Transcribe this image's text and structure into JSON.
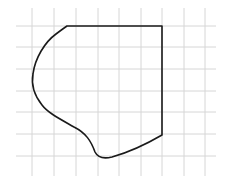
{
  "diagram": {
    "type": "shape-on-grid",
    "colors": {
      "background": "#ffffff",
      "grid": "#d6d6d6",
      "outline": "#1a1a1a"
    },
    "grid": {
      "vertical_x": [
        32,
        54,
        76,
        98,
        119,
        141,
        162,
        184,
        205
      ],
      "vertical_y_range": [
        8,
        176
      ],
      "horizontal_y": [
        26,
        47,
        69,
        91,
        112,
        134,
        156
      ],
      "horizontal_x_range": [
        16,
        216
      ]
    },
    "shape": {
      "description": "Closed outline: straight top edge and straight right edge, curved left and bottom boundary",
      "path": "M 67 26 L 162 26 L 162 135 C 150 142, 130 152, 112 157 C 104 159, 98 158, 95 152 C 91 141, 86 133, 74 127 C 60 119, 48 113, 42 105 C 34 95, 31 85, 33 74 C 35 58, 45 42, 56 34 C 60 31, 64 28, 67 26 Z"
    }
  }
}
